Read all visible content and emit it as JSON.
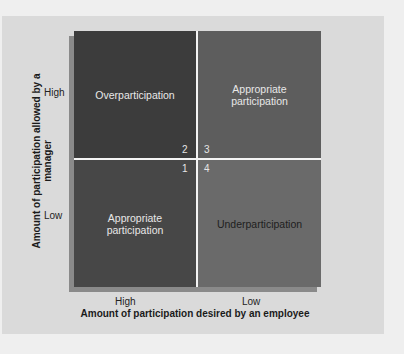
{
  "y_axis": {
    "label": "Amount of participation allowed by a manager",
    "ticks": [
      "High",
      "Low"
    ]
  },
  "x_axis": {
    "label": "Amount of participation desired by an employee",
    "ticks": [
      "High",
      "Low"
    ]
  },
  "quadrants": [
    {
      "label": "Overparticipation",
      "number": "2"
    },
    {
      "label": "Appropriate participation",
      "number": "3"
    },
    {
      "label": "Appropriate participation",
      "number": "1"
    },
    {
      "label": "Underparticipation",
      "number": "4"
    }
  ],
  "colors": {
    "background": "#efefef",
    "panel": "#dadada",
    "top_left": "#3c3c3c",
    "top_right": "#5d5d5d",
    "bottom_left": "#474747",
    "bottom_right": "#6a6a6a",
    "divider": "#f4f4f4"
  }
}
